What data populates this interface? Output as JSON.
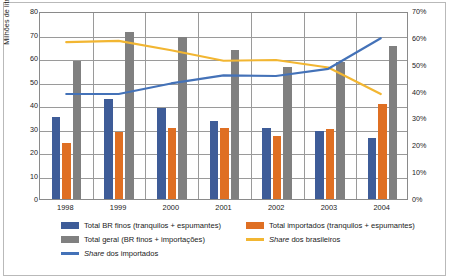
{
  "chart_data": {
    "type": "bar",
    "title": "",
    "xlabel": "",
    "ylabel": "Milhões de litros",
    "y2label": "",
    "categories": [
      "1998",
      "1999",
      "2000",
      "2001",
      "2002",
      "2003",
      "2004"
    ],
    "ylim": [
      0,
      80
    ],
    "yticks": [
      "0",
      "10",
      "20",
      "30",
      "40",
      "50",
      "60",
      "70",
      "80"
    ],
    "y2lim": [
      0,
      70
    ],
    "y2ticks": [
      "0%",
      "10%",
      "20%",
      "30%",
      "40%",
      "50%",
      "60%",
      "70%"
    ],
    "grid": true,
    "legend_position": "bottom",
    "series": [
      {
        "name": "Total BR finos (tranquilos + espumantes)",
        "type": "bar",
        "axis": "left",
        "color": "#3E5C98",
        "values": [
          35.0,
          42.6,
          38.6,
          33.2,
          30.3,
          28.9,
          26.0
        ]
      },
      {
        "name": "Total importados (tranquilos + espumantes)",
        "type": "bar",
        "axis": "left",
        "color": "#DF6F23",
        "values": [
          23.8,
          28.6,
          30.3,
          30.4,
          27.0,
          30.0,
          40.4
        ]
      },
      {
        "name": "Total geral (BR finos + importações)",
        "type": "bar",
        "axis": "left",
        "color": "#808080",
        "values": [
          58.9,
          71.1,
          68.8,
          63.5,
          56.1,
          58.1,
          65.1
        ]
      },
      {
        "name": "Share dos brasileiros",
        "type": "line",
        "axis": "right",
        "color": "#F2B632",
        "values": [
          59.0,
          59.5,
          56.0,
          52.0,
          52.3,
          49.5,
          39.5
        ]
      },
      {
        "name": "Share dos importados",
        "type": "line",
        "axis": "right",
        "color": "#4472B8",
        "values": [
          39.5,
          39.5,
          43.5,
          46.5,
          46.3,
          49.0,
          60.5
        ]
      }
    ]
  },
  "legend": {
    "items": [
      {
        "label": "Total BR finos (tranquilos + espumantes)",
        "marker": "bar",
        "color": "#3E5C98",
        "italic_prefix": ""
      },
      {
        "label": "Total importados (tranquilos + espumantes)",
        "marker": "bar",
        "color": "#DF6F23",
        "italic_prefix": ""
      },
      {
        "label": "Total geral (BR finos + importações)",
        "marker": "bar",
        "color": "#808080",
        "italic_prefix": ""
      },
      {
        "label": "dos brasileiros",
        "marker": "line",
        "color": "#F2B632",
        "italic_prefix": "Share"
      },
      {
        "label": "dos importados",
        "marker": "line",
        "color": "#4472B8",
        "italic_prefix": "Share"
      }
    ]
  }
}
